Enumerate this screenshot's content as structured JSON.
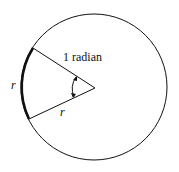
{
  "diagram": {
    "title_label": "1 radian",
    "arc_label": "r",
    "radius_label": "r",
    "colors": {
      "stroke": "#111111",
      "background": "#ffffff"
    }
  }
}
